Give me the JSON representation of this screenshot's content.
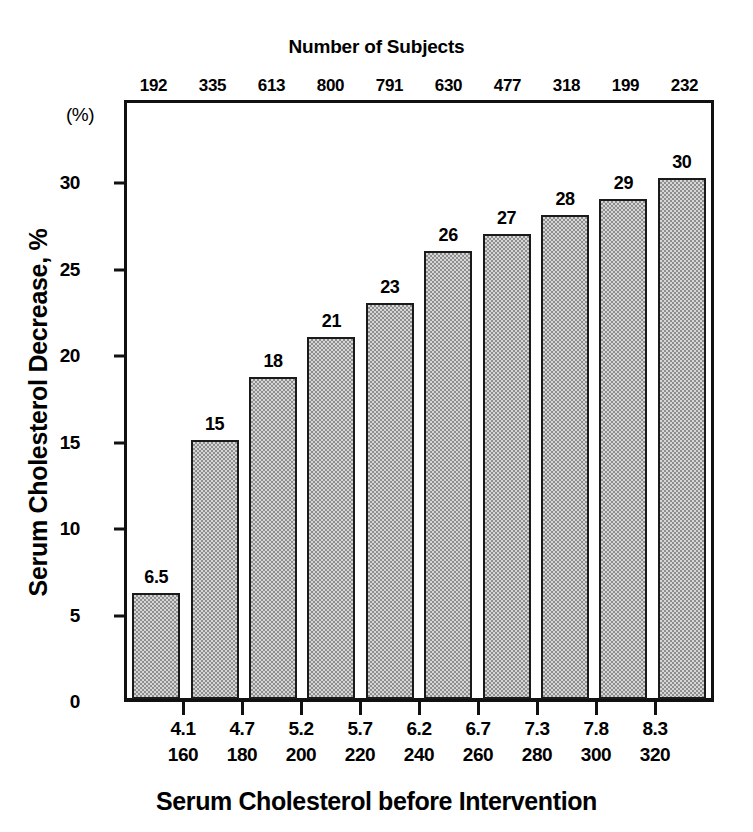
{
  "chart_data": {
    "type": "bar",
    "title": "",
    "top_title": "Number of Subjects",
    "xlabel": "Serum Cholesterol before Intervention",
    "ylabel": "Serum Cholesterol Decrease, %",
    "y_unit_note": "(%)",
    "ylim": [
      0,
      34.8
    ],
    "yticks": [
      0,
      5,
      10,
      15,
      20,
      25,
      30
    ],
    "ytick_labels": [
      "0",
      "5",
      "10",
      "15",
      "20",
      "25",
      "30"
    ],
    "grid": false,
    "legend": null,
    "bar_fill": "#d6d6d6",
    "bar_pattern": "stipple-checker",
    "bar_edge_color": "#1a1a1a",
    "axis_color": "#111111",
    "categories_mmol": [
      "4.1",
      "4.7",
      "5.2",
      "5.7",
      "6.2",
      "6.7",
      "7.3",
      "7.8",
      "8.3"
    ],
    "categories_mg": [
      "160",
      "180",
      "200",
      "220",
      "240",
      "260",
      "280",
      "300",
      "320"
    ],
    "unit_mmol_label": "mmolL",
    "unit_mg_label": "mg%",
    "values": [
      6.5,
      15,
      18,
      21,
      23,
      26,
      27,
      28,
      29,
      30
    ],
    "bar_heights_plotted": [
      6.1,
      15.0,
      18.6,
      20.9,
      22.9,
      25.9,
      26.9,
      28.0,
      28.9,
      30.1
    ],
    "value_labels": [
      "6.5",
      "15",
      "18",
      "21",
      "23",
      "26",
      "27",
      "28",
      "29",
      "30"
    ],
    "subject_counts": [
      192,
      335,
      613,
      800,
      791,
      630,
      477,
      318,
      199,
      232
    ],
    "subject_count_labels": [
      "192",
      "335",
      "613",
      "800",
      "791",
      "630",
      "477",
      "318",
      "199",
      "232"
    ]
  }
}
